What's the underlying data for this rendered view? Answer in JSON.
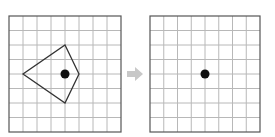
{
  "figure": {
    "colors": {
      "grid_line": "#b8b8b8",
      "grid_border": "#555555",
      "shape_stroke": "#333333",
      "dot": "#111111",
      "arrow": "#c8c8c8",
      "background": "#ffffff"
    },
    "left_grid": {
      "x": 9,
      "y": 16,
      "width": 112,
      "height": 116,
      "columns": 8,
      "rows": 8,
      "shape": {
        "type": "kite",
        "points": "65,45 79,74 65,103 23,74"
      },
      "dot": {
        "cx": 65,
        "cy": 74,
        "r": 4.5
      }
    },
    "arrow": {
      "points": "127,71 135,71 135,67 143,74 135,81 135,77 127,77"
    },
    "right_grid": {
      "x": 150,
      "y": 16,
      "width": 110,
      "height": 116,
      "columns": 8,
      "rows": 8,
      "dot": {
        "cx": 205,
        "cy": 74,
        "r": 4.5
      }
    }
  }
}
